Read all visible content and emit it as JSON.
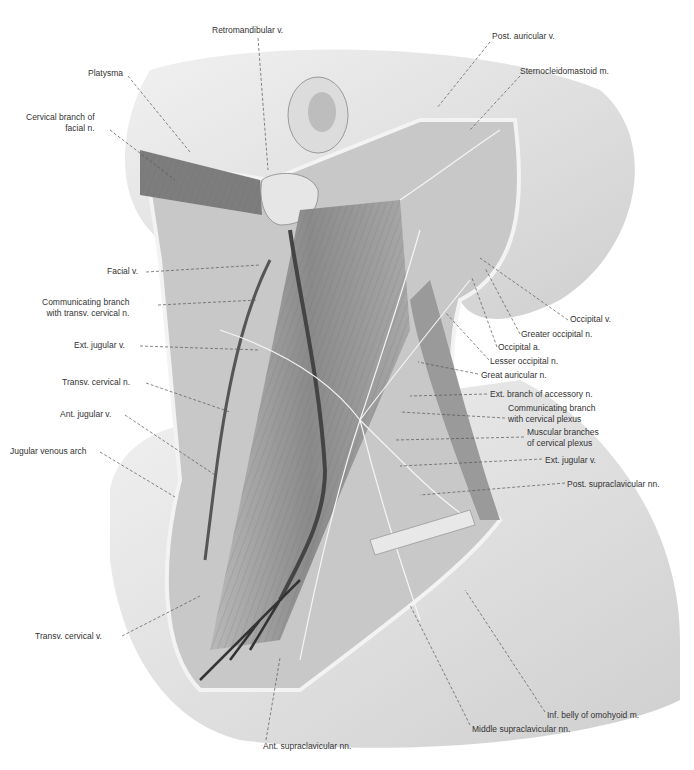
{
  "figure": {
    "labels": [
      {
        "id": "retromandibular-v",
        "text": "Retromandibular v.",
        "x": 212,
        "y": 25,
        "align": "left",
        "tx": 268,
        "ty": 170,
        "lx": 258,
        "ly": 38
      },
      {
        "id": "post-auricular-v",
        "text": "Post. auricular v.",
        "x": 492,
        "y": 31,
        "align": "left",
        "tx": 437,
        "ty": 108,
        "lx": 490,
        "ly": 42
      },
      {
        "id": "platysma",
        "text": "Platysma",
        "x": 88,
        "y": 68,
        "align": "left",
        "tx": 190,
        "ty": 152,
        "lx": 128,
        "ly": 76
      },
      {
        "id": "sternocleidomastoid-m",
        "text": "Sternocleidomastoid m.",
        "x": 520,
        "y": 66,
        "align": "left",
        "tx": 470,
        "ty": 130,
        "lx": 520,
        "ly": 76
      },
      {
        "id": "cervical-branch-facial-n",
        "text": "Cervical branch of\nfacial n.",
        "x": 26,
        "y": 112,
        "align": "right",
        "tx": 175,
        "ty": 180,
        "lx": 110,
        "ly": 130
      },
      {
        "id": "facial-v",
        "text": "Facial v.",
        "x": 107,
        "y": 266,
        "align": "right",
        "tx": 260,
        "ty": 265,
        "lx": 146,
        "ly": 272
      },
      {
        "id": "comm-branch-transv-cervical-n",
        "text": "Communicating branch\nwith transv. cervical n.",
        "x": 42,
        "y": 297,
        "align": "right",
        "tx": 258,
        "ty": 300,
        "lx": 158,
        "ly": 305
      },
      {
        "id": "ext-jugular-v-left",
        "text": "Ext. jugular v.",
        "x": 74,
        "y": 340,
        "align": "right",
        "tx": 260,
        "ty": 350,
        "lx": 140,
        "ly": 346
      },
      {
        "id": "transv-cervical-n",
        "text": "Transv. cervical n.",
        "x": 62,
        "y": 377,
        "align": "right",
        "tx": 230,
        "ty": 412,
        "lx": 146,
        "ly": 383
      },
      {
        "id": "ant-jugular-v",
        "text": "Ant. jugular v.",
        "x": 60,
        "y": 409,
        "align": "right",
        "tx": 215,
        "ty": 475,
        "lx": 125,
        "ly": 415
      },
      {
        "id": "jugular-venous-arch",
        "text": "Jugular venous arch",
        "x": 10,
        "y": 446,
        "align": "right",
        "tx": 175,
        "ty": 497,
        "lx": 100,
        "ly": 452
      },
      {
        "id": "occipital-v",
        "text": "Occipital v.",
        "x": 570,
        "y": 314,
        "align": "left",
        "tx": 480,
        "ty": 258,
        "lx": 568,
        "ly": 320
      },
      {
        "id": "greater-occipital-n",
        "text": "Greater occipital n.",
        "x": 521,
        "y": 329,
        "align": "left",
        "tx": 485,
        "ty": 268,
        "lx": 520,
        "ly": 334
      },
      {
        "id": "occipital-a",
        "text": "Occipital a.",
        "x": 498,
        "y": 342,
        "align": "left",
        "tx": 472,
        "ty": 278,
        "lx": 497,
        "ly": 347
      },
      {
        "id": "lesser-occipital-n",
        "text": "Lesser occipital n.",
        "x": 490,
        "y": 356,
        "align": "left",
        "tx": 445,
        "ty": 312,
        "lx": 489,
        "ly": 360
      },
      {
        "id": "great-auricular-n",
        "text": "Great auricular n.",
        "x": 481,
        "y": 370,
        "align": "left",
        "tx": 418,
        "ty": 362,
        "lx": 478,
        "ly": 374
      },
      {
        "id": "ext-branch-accessory-n",
        "text": "Ext. branch of accessory n.",
        "x": 490,
        "y": 389,
        "align": "left",
        "tx": 410,
        "ty": 396,
        "lx": 487,
        "ly": 394
      },
      {
        "id": "comm-branch-cervical-plexus",
        "text": "Communicating branch\nwith cervical plexus",
        "x": 508,
        "y": 403,
        "align": "left",
        "tx": 400,
        "ty": 412,
        "lx": 505,
        "ly": 418
      },
      {
        "id": "muscular-branches-cervical-plexus",
        "text": "Muscular branches\nof cervical plexus",
        "x": 527,
        "y": 427,
        "align": "left",
        "tx": 395,
        "ty": 440,
        "lx": 524,
        "ly": 437
      },
      {
        "id": "ext-jugular-v-right",
        "text": "Ext. jugular v.",
        "x": 545,
        "y": 455,
        "align": "left",
        "tx": 400,
        "ty": 466,
        "lx": 542,
        "ly": 459
      },
      {
        "id": "post-supraclavicular-nn",
        "text": "Post. supraclavicular nn.",
        "x": 567,
        "y": 479,
        "align": "left",
        "tx": 420,
        "ty": 495,
        "lx": 565,
        "ly": 483
      },
      {
        "id": "transv-cervical-v",
        "text": "Transv. cervical v.",
        "x": 35,
        "y": 631,
        "align": "right",
        "tx": 200,
        "ty": 596,
        "lx": 122,
        "ly": 636
      },
      {
        "id": "inf-belly-omohyoid-m",
        "text": "Inf. belly of omohyoid m.",
        "x": 547,
        "y": 710,
        "align": "left",
        "tx": 465,
        "ty": 590,
        "lx": 545,
        "ly": 712
      },
      {
        "id": "middle-supraclavicular-nn",
        "text": "Middle supraclavicular nn.",
        "x": 472,
        "y": 724,
        "align": "left",
        "tx": 410,
        "ty": 605,
        "lx": 470,
        "ly": 725
      },
      {
        "id": "ant-supraclavicular-nn",
        "text": "Ant. supraclavicular nn.",
        "x": 263,
        "y": 741,
        "align": "left",
        "tx": 280,
        "ty": 658,
        "lx": 266,
        "ly": 740
      }
    ]
  }
}
